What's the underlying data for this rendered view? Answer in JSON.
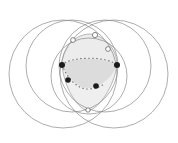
{
  "figure": {
    "type": "geometric-diagram",
    "canvas": {
      "width": 178,
      "height": 143,
      "background": "#ffffff"
    },
    "style": {
      "circle_stroke": "#8a8a8a",
      "circle_stroke_width": 0.7,
      "circle_fill": "none",
      "region_fill": "#dcdcdc",
      "region_fill_light": "#e9e9e9",
      "region_stroke": "#9a9a9a",
      "dotted_stroke": "#6e6e6e",
      "vertex_fill_solid": "#1a1a1a",
      "vertex_fill_open": "#ffffff",
      "vertex_stroke": "#555555"
    },
    "circles": [
      {
        "name": "circle-left",
        "cx": 63,
        "cy": 74,
        "r": 54
      },
      {
        "name": "circle-right",
        "cx": 114,
        "cy": 74,
        "r": 54
      },
      {
        "name": "circle-upper-left",
        "cx": 72,
        "cy": 66,
        "r": 46
      },
      {
        "name": "circle-upper-right",
        "cx": 105,
        "cy": 66,
        "r": 46
      },
      {
        "name": "circle-inner-center",
        "cx": 89,
        "cy": 76,
        "r": 38
      }
    ],
    "shaded_regions": [
      {
        "name": "central-lens",
        "description": "dark shaded lens / intersection core",
        "fill": "#dcdcdc"
      },
      {
        "name": "upper-cap",
        "description": "light shaded cap above the lens",
        "fill": "#ececec"
      },
      {
        "name": "lower-cusp",
        "description": "light shaded teardrop below the lens",
        "fill": "#efefef"
      }
    ],
    "vertices": [
      {
        "name": "vertex-left",
        "x": 62,
        "y": 65,
        "style": "solid",
        "r": 3.0
      },
      {
        "name": "vertex-right",
        "x": 117,
        "y": 65,
        "style": "solid",
        "r": 3.0
      },
      {
        "name": "vertex-lower-left",
        "x": 68,
        "y": 80,
        "style": "solid",
        "r": 2.8
      },
      {
        "name": "vertex-lower-right",
        "x": 96,
        "y": 86,
        "style": "solid",
        "r": 2.8
      },
      {
        "name": "vertex-top-apex",
        "x": 95,
        "y": 35,
        "style": "open",
        "r": 2.6
      },
      {
        "name": "vertex-top-left",
        "x": 73,
        "y": 40,
        "style": "open",
        "r": 2.4
      },
      {
        "name": "vertex-upper-right",
        "x": 108,
        "y": 49,
        "style": "open",
        "r": 2.4
      },
      {
        "name": "vertex-bottom-cusp",
        "x": 88,
        "y": 110,
        "style": "open",
        "r": 2.2
      }
    ],
    "dotted_arcs": [
      {
        "name": "dotted-arc-upper",
        "description": "dotted boundary along top of central lens"
      },
      {
        "name": "dotted-arc-lower",
        "description": "dotted boundary along bottom of central lens"
      }
    ]
  }
}
